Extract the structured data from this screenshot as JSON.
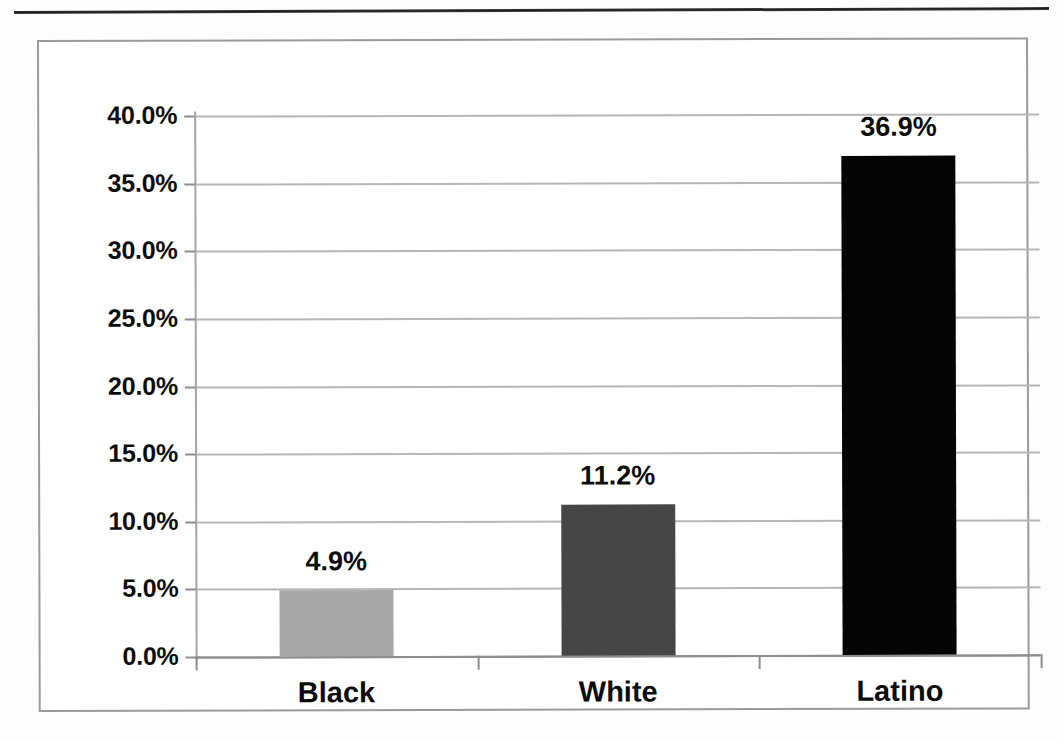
{
  "page": {
    "top_rule": "horizontal-rule"
  },
  "chart_data": {
    "type": "bar",
    "title": "",
    "subtitle": "",
    "xlabel": "",
    "ylabel": "",
    "categories": [
      "Black",
      "White",
      "Latino"
    ],
    "values": [
      4.9,
      11.2,
      36.9
    ],
    "value_labels": [
      "4.9%",
      "11.2%",
      "36.9%"
    ],
    "bar_colors": [
      "#a8a8a8",
      "#464646",
      "#050505"
    ],
    "ylim": [
      0,
      40
    ],
    "ytick_values": [
      0,
      5,
      10,
      15,
      20,
      25,
      30,
      35,
      40
    ],
    "ytick_labels": [
      "0.0%",
      "5.0%",
      "10.0%",
      "15.0%",
      "20.0%",
      "25.0%",
      "30.0%",
      "35.0%",
      "40.0%"
    ],
    "grid": true,
    "grid_axis": "y",
    "legend": false,
    "legend_position": "none",
    "units": "percent",
    "gridline_color": "#b6b6b6",
    "axis_color": "#8d8d8d",
    "frame_color": "#9a9a9a",
    "text_color": "#0b0b0b",
    "background": "#ffffff"
  }
}
